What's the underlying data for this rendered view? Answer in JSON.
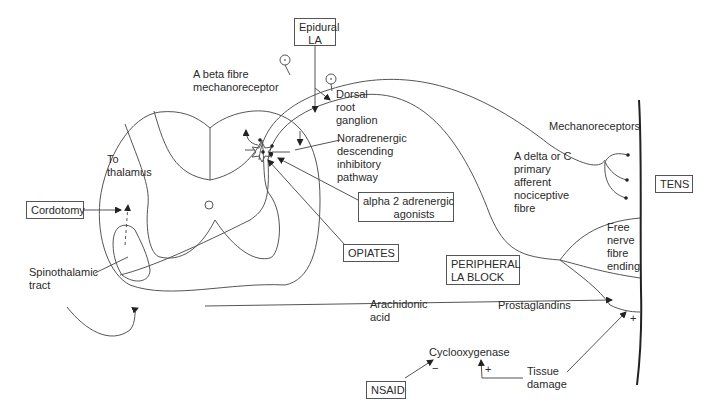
{
  "diagram": {
    "boxes": {
      "epidural_la": "Epidural\nLA",
      "cordotomy": "Cordotomy",
      "alpha2": "alpha 2 adrenergic\n          agonists",
      "opiates": "OPIATES",
      "peripheral_la_block": "PERIPHERAL\nLA BLOCK",
      "tens": "TENS",
      "nsaid": "NSAID"
    },
    "labels": {
      "a_beta": "A beta fibre\nmechanoreceptor",
      "dorsal_root_ganglion": "Dorsal\nroot\nganglion",
      "noradrenergic": "Noradrenergic\ndescending\ninhibitory\npathway",
      "to_thalamus": "To\nthalamus",
      "spinothalamic": "Spinothalamic\ntract",
      "mechanoreceptors": "Mechanoreceptors",
      "a_delta_c": "A delta or C\nprimary\nafferent\nnociceptive\nfibre",
      "free_nerve": "Free\nnerve\nfibre\nending",
      "arachidonic": "Arachidonic\nacid",
      "prostaglandins": "Prostaglandins",
      "cyclooxygenase": "Cyclooxygenase",
      "tissue_damage": "Tissue\ndamage",
      "minus_nsaid": "−",
      "plus_tissue": "+",
      "plus_skin": "+"
    },
    "colors": {
      "line": "#555555",
      "text": "#2a2a2a",
      "skin": "#222222"
    }
  }
}
